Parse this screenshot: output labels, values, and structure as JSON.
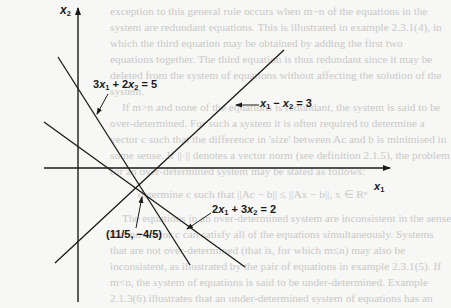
{
  "figure": {
    "axes": {
      "x_label": "x1",
      "y_label": "x2"
    },
    "lines": [
      {
        "id": "eq1",
        "equation": "3x1 + 2x2 = 5",
        "parts": [
          "3",
          "x",
          "1",
          " + 2",
          "x",
          "2",
          " = 5"
        ]
      },
      {
        "id": "eq2",
        "equation": "x1 − x2 = 3",
        "parts": [
          "x",
          "1",
          " − ",
          "x",
          "2",
          " = 3"
        ]
      },
      {
        "id": "eq3",
        "equation": "2x1 + 3x2 = 2",
        "parts": [
          "2",
          "x",
          "1",
          " + 3",
          "x",
          "2",
          " = 2"
        ]
      }
    ],
    "intersection": {
      "label": "(11/5, −4/5)",
      "x": "11/5",
      "y": "−4/5"
    },
    "colors": {
      "ink": "#1a1a1a",
      "paper": "#f7f7f5",
      "bleed_text": "#c9c9c6"
    }
  },
  "bleed_through_text": [
    "exception to this general rule occurs when m−n of the equations in the",
    "system are redundant equations. This is illustrated in example 2.3.1(4), in",
    "which the third equation may be obtained by adding the first two",
    "equations together. The third equation is thus redundant since it may be",
    "deleted from the system of equations without affecting the solution of the",
    "system.",
    "If m>n and none of the equations is redundant, the system is said to be",
    "over-determined. For such a system it is often required to determine a",
    "vector c such that the difference in 'size' between Ac and b is minimised in",
    "some sense. If ||·|| denotes a vector norm (see definition 2.1.5), the problem",
    "for an over-determined system may be stated as follows:",
    "determine c such that ||Ac − b|| ≤ ||Ax − b||, x ∈ Rⁿ",
    "The equations in an over-determined system are inconsistent in the sense",
    "that no vector c can satisfy all of the equations simultaneously. Systems",
    "that are not over-determined (that is, for which m≤n) may also be",
    "inconsistent, as illustrated by the pair of equations in example 2.3.1(5). If",
    "m<n, the system of equations is said to be under-determined. Example",
    "2.1.3(6) illustrates that an under-determined system of equations has an"
  ]
}
